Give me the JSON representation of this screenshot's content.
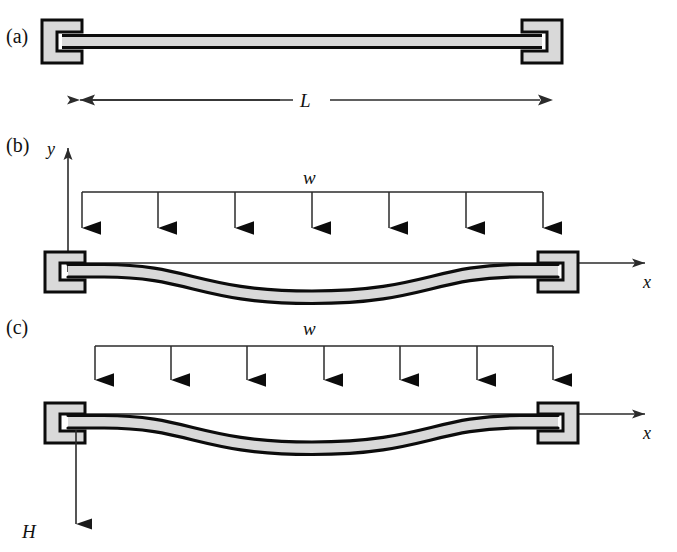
{
  "figure": {
    "background_color": "#ffffff",
    "ink_color": "#111111",
    "beam_fill_color": "#d9d9d9",
    "support_fill_color": "#d9d9d9",
    "thin_line_color": "#3a3a3a",
    "panels": [
      {
        "id": "a",
        "label": "(a)",
        "description": "undeformed beam with two fixed supports",
        "beam_state": "straight",
        "supports": [
          "fixed-left",
          "fixed-right"
        ],
        "dimension": {
          "name": "span-dimension",
          "label": "L",
          "style": "double-headed-arrow"
        }
      },
      {
        "id": "b",
        "label": "(b)",
        "description": "beam under uniform distributed load with coordinate axes",
        "beam_state": "deflected",
        "supports": [
          "fixed-left",
          "fixed-right"
        ],
        "load": {
          "name": "uniform-distributed-load",
          "label": "w",
          "arrow_count": 7,
          "direction": "down"
        },
        "axes": [
          {
            "name": "y-axis",
            "label": "y",
            "direction": "up"
          },
          {
            "name": "x-axis",
            "label": "x",
            "direction": "right"
          }
        ]
      },
      {
        "id": "c",
        "label": "(c)",
        "description": "beam under uniform distributed load with support reaction H",
        "beam_state": "deflected",
        "supports": [
          "fixed-left",
          "fixed-right"
        ],
        "load": {
          "name": "uniform-distributed-load",
          "label": "w",
          "arrow_count": 7,
          "direction": "down"
        },
        "axes": [
          {
            "name": "x-axis",
            "label": "x",
            "direction": "right"
          }
        ],
        "reaction": {
          "name": "reaction-force",
          "label": "H",
          "direction": "down"
        }
      }
    ]
  },
  "labels": {
    "panel_a": "(a)",
    "panel_b": "(b)",
    "panel_c": "(c)",
    "span": "L",
    "load_b": "w",
    "load_c": "w",
    "axis_y": "y",
    "axis_x_b": "x",
    "axis_x_c": "x",
    "reaction_h": "H"
  }
}
